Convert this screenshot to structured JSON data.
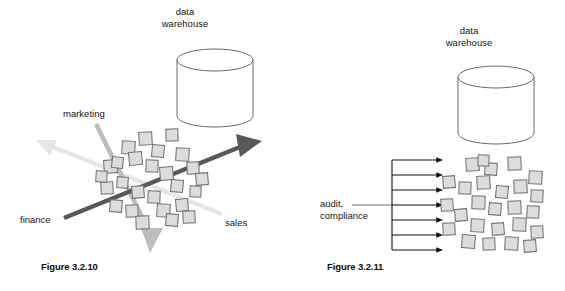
{
  "page": {
    "background": "#ffffff",
    "width": 565,
    "height": 291
  },
  "palette": {
    "square_fill": "#dcdcdc",
    "square_stroke": "#6e6e6e",
    "cylinder_stroke": "#5a5a5a",
    "cylinder_fill": "#ffffff",
    "arrow_dark": "#58585a",
    "arrow_mid": "#bdbdbd",
    "arrow_light": "#e3e3e3",
    "arrow_black": "#111111",
    "text": "#161616",
    "caption_text": "#0d0d0d"
  },
  "figures": [
    {
      "id": "figure-3-2-10",
      "caption": "Figure 3.2.10",
      "warehouse_label_line1": "data",
      "warehouse_label_line2": "warehouse",
      "axes": [
        {
          "name": "marketing",
          "label": "marketing",
          "color": "#bdbdbd",
          "direction": "down-right"
        },
        {
          "name": "finance",
          "label": "finance",
          "color": "#58585a",
          "direction": "up-right"
        },
        {
          "name": "sales",
          "label": "sales",
          "color": "#e3e3e3",
          "direction": "up-left"
        }
      ],
      "square_count": 26,
      "cylinder": {
        "cx": 215,
        "cy": 88,
        "rx": 38,
        "ry": 11,
        "height": 56
      }
    },
    {
      "id": "figure-3-2-11",
      "caption": "Figure 3.2.11",
      "warehouse_label_line1": "data",
      "warehouse_label_line2": "warehouse",
      "flow_label_line1": "audit,",
      "flow_label_line2": "compliance",
      "arrow_count": 7,
      "square_count": 26,
      "cylinder": {
        "cx": 496,
        "cy": 105,
        "rx": 38,
        "ry": 11,
        "height": 56
      }
    }
  ],
  "left_squares": [
    {
      "x": 104,
      "y": 160,
      "s": 13,
      "r": -4
    },
    {
      "x": 122,
      "y": 141,
      "s": 13,
      "r": 3
    },
    {
      "x": 139,
      "y": 132,
      "s": 13,
      "r": -3
    },
    {
      "x": 152,
      "y": 145,
      "s": 12,
      "r": 5
    },
    {
      "x": 166,
      "y": 129,
      "s": 12,
      "r": -2
    },
    {
      "x": 112,
      "y": 157,
      "s": 11,
      "r": 6
    },
    {
      "x": 129,
      "y": 152,
      "s": 13,
      "r": -5
    },
    {
      "x": 146,
      "y": 160,
      "s": 12,
      "r": 2
    },
    {
      "x": 101,
      "y": 182,
      "s": 12,
      "r": -3
    },
    {
      "x": 117,
      "y": 177,
      "s": 11,
      "r": 4
    },
    {
      "x": 160,
      "y": 167,
      "s": 13,
      "r": -4
    },
    {
      "x": 176,
      "y": 148,
      "s": 13,
      "r": 3
    },
    {
      "x": 187,
      "y": 162,
      "s": 12,
      "r": -2
    },
    {
      "x": 171,
      "y": 180,
      "s": 12,
      "r": 5
    },
    {
      "x": 132,
      "y": 186,
      "s": 12,
      "r": -4
    },
    {
      "x": 148,
      "y": 191,
      "s": 12,
      "r": 2
    },
    {
      "x": 110,
      "y": 200,
      "s": 12,
      "r": 4
    },
    {
      "x": 126,
      "y": 205,
      "s": 12,
      "r": -3
    },
    {
      "x": 157,
      "y": 204,
      "s": 13,
      "r": 3
    },
    {
      "x": 176,
      "y": 199,
      "s": 12,
      "r": -5
    },
    {
      "x": 190,
      "y": 186,
      "s": 11,
      "r": 2
    },
    {
      "x": 136,
      "y": 216,
      "s": 13,
      "r": -2
    },
    {
      "x": 166,
      "y": 214,
      "s": 12,
      "r": 4
    },
    {
      "x": 183,
      "y": 211,
      "s": 12,
      "r": -3
    },
    {
      "x": 96,
      "y": 171,
      "s": 11,
      "r": 3
    },
    {
      "x": 196,
      "y": 173,
      "s": 12,
      "r": -4
    }
  ],
  "right_squares": [
    {
      "x": 466,
      "y": 158,
      "s": 13,
      "r": -3
    },
    {
      "x": 485,
      "y": 163,
      "s": 12,
      "r": 4
    },
    {
      "x": 508,
      "y": 157,
      "s": 13,
      "r": -2
    },
    {
      "x": 529,
      "y": 171,
      "s": 13,
      "r": 3
    },
    {
      "x": 443,
      "y": 176,
      "s": 12,
      "r": -4
    },
    {
      "x": 459,
      "y": 182,
      "s": 12,
      "r": 2
    },
    {
      "x": 477,
      "y": 176,
      "s": 13,
      "r": -3
    },
    {
      "x": 496,
      "y": 186,
      "s": 12,
      "r": 5
    },
    {
      "x": 514,
      "y": 180,
      "s": 13,
      "r": -2
    },
    {
      "x": 531,
      "y": 190,
      "s": 12,
      "r": 3
    },
    {
      "x": 441,
      "y": 199,
      "s": 12,
      "r": -3
    },
    {
      "x": 472,
      "y": 196,
      "s": 13,
      "r": 2
    },
    {
      "x": 455,
      "y": 209,
      "s": 12,
      "r": -4
    },
    {
      "x": 489,
      "y": 203,
      "s": 12,
      "r": 4
    },
    {
      "x": 508,
      "y": 201,
      "s": 13,
      "r": -2
    },
    {
      "x": 527,
      "y": 206,
      "s": 12,
      "r": 3
    },
    {
      "x": 443,
      "y": 223,
      "s": 12,
      "r": -3
    },
    {
      "x": 471,
      "y": 219,
      "s": 13,
      "r": 3
    },
    {
      "x": 492,
      "y": 223,
      "s": 12,
      "r": -4
    },
    {
      "x": 513,
      "y": 218,
      "s": 13,
      "r": 2
    },
    {
      "x": 531,
      "y": 226,
      "s": 12,
      "r": -3
    },
    {
      "x": 462,
      "y": 235,
      "s": 13,
      "r": 4
    },
    {
      "x": 483,
      "y": 238,
      "s": 12,
      "r": -2
    },
    {
      "x": 505,
      "y": 237,
      "s": 13,
      "r": 3
    },
    {
      "x": 524,
      "y": 240,
      "s": 12,
      "r": -4
    },
    {
      "x": 478,
      "y": 155,
      "s": 11,
      "r": 2
    }
  ],
  "right_arrows": {
    "spine_x": 392,
    "tip_x": 438,
    "ys": [
      160,
      175,
      190,
      205,
      220,
      235,
      250
    ]
  }
}
